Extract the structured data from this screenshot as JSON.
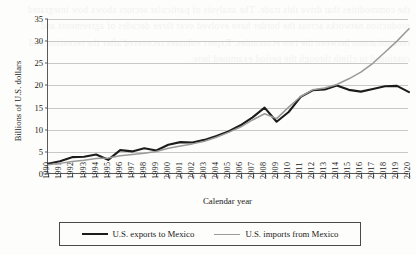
{
  "chart_data": {
    "type": "line",
    "title": "",
    "xlabel": "Calendar year",
    "ylabel": "Billions of U.S. dollars",
    "ylim": [
      0,
      35
    ],
    "yticks": [
      0,
      5,
      10,
      15,
      20,
      25,
      30,
      35
    ],
    "grid": true,
    "legend_position": "below",
    "x": [
      1990,
      1991,
      1992,
      1993,
      1994,
      1995,
      1996,
      1997,
      1998,
      1999,
      2000,
      2001,
      2002,
      2003,
      2004,
      2005,
      2006,
      2007,
      2008,
      2009,
      2010,
      2011,
      2012,
      2013,
      2014,
      2015,
      2016,
      2017,
      2018,
      2019,
      2020
    ],
    "categories": [
      "1990",
      "1991",
      "1992",
      "1993",
      "1994",
      "1995",
      "1996",
      "1997",
      "1998",
      "1999",
      "2000",
      "2001",
      "2002",
      "2003",
      "2004",
      "2005",
      "2006",
      "2007",
      "2008",
      "2009",
      "2010",
      "2011",
      "2012",
      "2013",
      "2014",
      "2015",
      "2016",
      "2017",
      "2018",
      "2019",
      "2020"
    ],
    "series": [
      {
        "name": "U.S. exports to Mexico",
        "color": "#1c1c1c",
        "values": [
          2.3,
          2.9,
          3.8,
          3.9,
          4.4,
          3.2,
          5.4,
          5.1,
          5.8,
          5.3,
          6.6,
          7.2,
          7.1,
          7.7,
          8.6,
          9.6,
          11.0,
          12.8,
          15.0,
          11.8,
          14.0,
          17.4,
          18.9,
          19.1,
          20.0,
          19.0,
          18.6,
          19.2,
          19.8,
          19.9,
          18.5
        ]
      },
      {
        "name": "U.S. imports from Mexico",
        "color": "#9a9a9a",
        "values": [
          2.1,
          2.4,
          2.8,
          3.1,
          3.5,
          3.6,
          4.1,
          4.4,
          4.7,
          5.1,
          5.8,
          6.3,
          6.8,
          7.4,
          8.3,
          9.4,
          10.6,
          12.2,
          13.6,
          12.5,
          15.1,
          17.5,
          19.0,
          19.4,
          20.2,
          21.5,
          23.0,
          25.0,
          27.5,
          30.0,
          32.8
        ]
      }
    ]
  },
  "legend": {
    "entries": [
      {
        "label": "U.S. exports to Mexico"
      },
      {
        "label": "U.S. imports from Mexico"
      }
    ]
  },
  "bleed_text": "the commodities that drive this trade. The analysis of particular sectors shows how integrated production networks across the border have evolved over three decades of agreements and renegotiations between the two economies. Export volumes recovered after the recession and continued to climb through the period examined here."
}
